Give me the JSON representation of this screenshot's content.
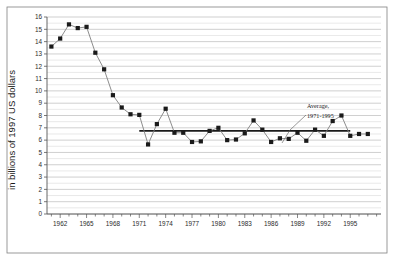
{
  "chart_data": {
    "type": "line",
    "title": "",
    "subtitle": "",
    "xlabel": "",
    "ylabel": "in billions of 1997 US dollars",
    "xlim": [
      1960.5,
      1998.5
    ],
    "ylim": [
      0,
      16
    ],
    "grid": true,
    "grid_axis": "y",
    "legend": false,
    "marker": "square",
    "x": [
      1961,
      1962,
      1963,
      1964,
      1965,
      1966,
      1967,
      1968,
      1969,
      1970,
      1971,
      1972,
      1973,
      1974,
      1975,
      1976,
      1977,
      1978,
      1979,
      1980,
      1981,
      1982,
      1983,
      1984,
      1985,
      1986,
      1987,
      1988,
      1989,
      1990,
      1991,
      1992,
      1993,
      1994,
      1995,
      1996,
      1997
    ],
    "values": [
      13.6,
      14.25,
      15.4,
      15.1,
      15.2,
      13.1,
      11.75,
      9.65,
      8.65,
      8.1,
      8.05,
      5.65,
      7.3,
      8.55,
      6.6,
      6.6,
      5.85,
      5.9,
      6.75,
      7.0,
      6.0,
      6.05,
      6.55,
      7.6,
      6.85,
      5.85,
      6.15,
      6.1,
      6.6,
      5.95,
      6.85,
      6.35,
      7.55,
      8.0,
      6.35,
      6.5,
      6.5
    ],
    "ytick_labels": [
      "0",
      "1",
      "2",
      "3",
      "4",
      "5",
      "6",
      "7",
      "8",
      "9",
      "10",
      "11",
      "12",
      "13",
      "14",
      "15",
      "16"
    ],
    "ytick_values": [
      0,
      1,
      2,
      3,
      4,
      5,
      6,
      7,
      8,
      9,
      10,
      11,
      12,
      13,
      14,
      15,
      16
    ],
    "xtick_labels": [
      "1962",
      "1965",
      "1968",
      "1971",
      "1974",
      "1977",
      "1980",
      "1983",
      "1986",
      "1989",
      "1992",
      "1995"
    ],
    "xtick_values": [
      1962,
      1965,
      1968,
      1971,
      1974,
      1977,
      1980,
      1983,
      1986,
      1989,
      1992,
      1995
    ],
    "annotations": [
      {
        "name": "average-annotation",
        "line1": "Average,",
        "line2": "1971-1995",
        "value": 6.75,
        "x_start": 1971,
        "x_end": 1995
      }
    ],
    "colors": {
      "series_line": "#808080",
      "marker_fill": "#1a1a1a",
      "average_line": "#1a1a1a",
      "gridline": "#b0b0b0",
      "axis": "#555555",
      "background": "#ffffff"
    }
  }
}
